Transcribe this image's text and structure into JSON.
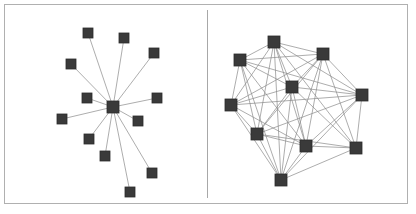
{
  "figure": {
    "background_color": "#ffffff",
    "frame": {
      "name": "figure-border",
      "color": "#b0b0b0",
      "x": 4,
      "y": 4,
      "width": 404,
      "height": 200,
      "stroke_width": 1
    },
    "divider": {
      "name": "panel-divider",
      "color": "#a8a8a8",
      "x": 207,
      "y1": 10,
      "y2": 198,
      "stroke_width": 1
    }
  },
  "style": {
    "node_color": "#3a3a3a",
    "node_edge_color": "#2b2b2b",
    "edge_color": "#8a8a8a",
    "edge_width": 0.7
  },
  "chart_data": {
    "type": "diagram",
    "subtitle": "",
    "xlabel": "",
    "ylabel": "",
    "grid": false,
    "legend": "none",
    "panels": [
      {
        "id": "left",
        "name": "star-topology-panel",
        "label": "Star / hub-and-spoke topology",
        "node_count": 13,
        "edge_count": 12,
        "node_size": 10,
        "hub_node_size": 12,
        "hub_index": 0,
        "nodes": [
          {
            "id": 0,
            "label": "hub",
            "x": 113,
            "y": 107,
            "size": 12
          },
          {
            "id": 1,
            "label": "n1",
            "x": 88,
            "y": 33,
            "size": 10
          },
          {
            "id": 2,
            "label": "n2",
            "x": 124,
            "y": 38,
            "size": 10
          },
          {
            "id": 3,
            "label": "n3",
            "x": 154,
            "y": 53,
            "size": 10
          },
          {
            "id": 4,
            "label": "n4",
            "x": 71,
            "y": 64,
            "size": 10
          },
          {
            "id": 5,
            "label": "n5",
            "x": 87,
            "y": 98,
            "size": 10
          },
          {
            "id": 6,
            "label": "n6",
            "x": 157,
            "y": 98,
            "size": 10
          },
          {
            "id": 7,
            "label": "n7",
            "x": 62,
            "y": 119,
            "size": 10
          },
          {
            "id": 8,
            "label": "n8",
            "x": 138,
            "y": 121,
            "size": 10
          },
          {
            "id": 9,
            "label": "n9",
            "x": 89,
            "y": 139,
            "size": 10
          },
          {
            "id": 10,
            "label": "n10",
            "x": 105,
            "y": 156,
            "size": 10
          },
          {
            "id": 11,
            "label": "n11",
            "x": 152,
            "y": 173,
            "size": 10
          },
          {
            "id": 12,
            "label": "n12",
            "x": 130,
            "y": 192,
            "size": 10
          }
        ],
        "edges": [
          [
            0,
            1
          ],
          [
            0,
            2
          ],
          [
            0,
            3
          ],
          [
            0,
            4
          ],
          [
            0,
            5
          ],
          [
            0,
            6
          ],
          [
            0,
            7
          ],
          [
            0,
            8
          ],
          [
            0,
            9
          ],
          [
            0,
            10
          ],
          [
            0,
            11
          ],
          [
            0,
            12
          ]
        ]
      },
      {
        "id": "right",
        "name": "mesh-topology-panel",
        "label": "Dense mesh topology",
        "node_count": 10,
        "edge_count": 43,
        "node_size": 12,
        "hub_index": null,
        "nodes": [
          {
            "id": 0,
            "label": "m1",
            "x": 274,
            "y": 42,
            "size": 12
          },
          {
            "id": 1,
            "label": "m2",
            "x": 323,
            "y": 54,
            "size": 12
          },
          {
            "id": 2,
            "label": "m3",
            "x": 240,
            "y": 60,
            "size": 12
          },
          {
            "id": 3,
            "label": "m4",
            "x": 292,
            "y": 87,
            "size": 12
          },
          {
            "id": 4,
            "label": "m5",
            "x": 362,
            "y": 95,
            "size": 12
          },
          {
            "id": 5,
            "label": "m6",
            "x": 231,
            "y": 105,
            "size": 12
          },
          {
            "id": 6,
            "label": "m7",
            "x": 257,
            "y": 134,
            "size": 12
          },
          {
            "id": 7,
            "label": "m8",
            "x": 306,
            "y": 146,
            "size": 12
          },
          {
            "id": 8,
            "label": "m9",
            "x": 356,
            "y": 148,
            "size": 12
          },
          {
            "id": 9,
            "label": "m10",
            "x": 281,
            "y": 180,
            "size": 12
          }
        ],
        "edges": [
          [
            0,
            1
          ],
          [
            0,
            2
          ],
          [
            0,
            3
          ],
          [
            0,
            4
          ],
          [
            0,
            5
          ],
          [
            0,
            6
          ],
          [
            0,
            7
          ],
          [
            0,
            8
          ],
          [
            0,
            9
          ],
          [
            1,
            2
          ],
          [
            1,
            3
          ],
          [
            1,
            4
          ],
          [
            1,
            5
          ],
          [
            1,
            6
          ],
          [
            1,
            7
          ],
          [
            1,
            8
          ],
          [
            1,
            9
          ],
          [
            2,
            3
          ],
          [
            2,
            4
          ],
          [
            2,
            5
          ],
          [
            2,
            6
          ],
          [
            2,
            7
          ],
          [
            2,
            9
          ],
          [
            3,
            4
          ],
          [
            3,
            5
          ],
          [
            3,
            6
          ],
          [
            3,
            7
          ],
          [
            3,
            8
          ],
          [
            3,
            9
          ],
          [
            4,
            5
          ],
          [
            4,
            6
          ],
          [
            4,
            7
          ],
          [
            4,
            8
          ],
          [
            4,
            9
          ],
          [
            5,
            6
          ],
          [
            5,
            7
          ],
          [
            5,
            9
          ],
          [
            6,
            7
          ],
          [
            6,
            8
          ],
          [
            6,
            9
          ],
          [
            7,
            8
          ],
          [
            7,
            9
          ],
          [
            8,
            9
          ]
        ]
      }
    ]
  }
}
